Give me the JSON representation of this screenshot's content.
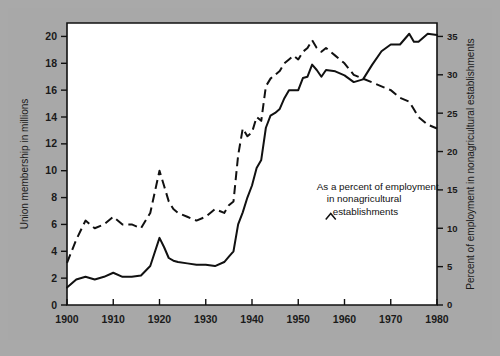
{
  "chart_data": {
    "type": "line",
    "title": "",
    "xlabel": "",
    "ylabel": "Union membership in millions",
    "y2label": "Percent of employment in nonagricultural establishments",
    "xlim": [
      1900,
      1980
    ],
    "ylim": [
      0,
      21
    ],
    "y2lim": [
      0,
      36.75
    ],
    "grid": false,
    "legend": "none",
    "xticks": [
      "1900",
      "1910",
      "1920",
      "1930",
      "1940",
      "1950",
      "1960",
      "1970",
      "1980"
    ],
    "xtick_values": [
      1900,
      1910,
      1920,
      1930,
      1940,
      1950,
      1960,
      1970,
      1980
    ],
    "yticks": [
      "0",
      "2",
      "4",
      "6",
      "8",
      "10",
      "12",
      "14",
      "16",
      "18",
      "20"
    ],
    "ytick_values": [
      0,
      2,
      4,
      6,
      8,
      10,
      12,
      14,
      16,
      18,
      20
    ],
    "y2ticks": [
      "0",
      "5",
      "10",
      "15",
      "20",
      "25",
      "30",
      "35"
    ],
    "y2tick_values": [
      0,
      5,
      10,
      15,
      20,
      25,
      30,
      35
    ],
    "annotations": [
      {
        "name": "percent-series-annotation",
        "lines": [
          "As a percent of employment",
          "in nonagricultural",
          "establishments"
        ],
        "x": 1954,
        "y": 8.6
      }
    ],
    "series": [
      {
        "name": "Union membership in millions",
        "style": "solid",
        "axis": "left",
        "x": [
          1900,
          1902,
          1904,
          1906,
          1908,
          1910,
          1912,
          1914,
          1916,
          1918,
          1920,
          1921,
          1922,
          1923,
          1924,
          1926,
          1928,
          1930,
          1932,
          1934,
          1935,
          1936,
          1937,
          1938,
          1939,
          1940,
          1941,
          1942,
          1943,
          1944,
          1945,
          1946,
          1947,
          1948,
          1949,
          1950,
          1951,
          1952,
          1953,
          1954,
          1955,
          1956,
          1958,
          1960,
          1962,
          1964,
          1966,
          1968,
          1970,
          1972,
          1974,
          1975,
          1976,
          1978,
          1980
        ],
        "values": [
          1.3,
          1.9,
          2.1,
          1.9,
          2.1,
          2.4,
          2.1,
          2.1,
          2.2,
          2.9,
          5.0,
          4.3,
          3.5,
          3.3,
          3.2,
          3.1,
          3.0,
          3.0,
          2.9,
          3.2,
          3.6,
          4.0,
          6.0,
          6.9,
          8.0,
          8.9,
          10.2,
          10.8,
          13.2,
          14.1,
          14.3,
          14.6,
          15.4,
          16.0,
          16.0,
          16.0,
          16.9,
          17.0,
          17.9,
          17.5,
          17.0,
          17.5,
          17.4,
          17.1,
          16.6,
          16.8,
          17.9,
          18.9,
          19.4,
          19.4,
          20.2,
          19.6,
          19.6,
          20.2,
          20.1
        ]
      },
      {
        "name": "As a percent of employment in nonagricultural establishments",
        "style": "dashed",
        "axis": "right",
        "x": [
          1900,
          1902,
          1904,
          1906,
          1908,
          1910,
          1912,
          1914,
          1916,
          1918,
          1920,
          1921,
          1922,
          1923,
          1924,
          1926,
          1928,
          1930,
          1932,
          1934,
          1935,
          1936,
          1937,
          1938,
          1939,
          1940,
          1941,
          1942,
          1943,
          1944,
          1945,
          1946,
          1947,
          1948,
          1949,
          1950,
          1951,
          1952,
          1953,
          1954,
          1955,
          1956,
          1958,
          1960,
          1962,
          1964,
          1966,
          1968,
          1970,
          1972,
          1974,
          1975,
          1976,
          1978,
          1980
        ],
        "values": [
          5.5,
          8.5,
          11.0,
          10.0,
          10.5,
          11.5,
          10.5,
          10.5,
          10.0,
          12.0,
          17.5,
          15.5,
          13.5,
          12.5,
          12.0,
          11.5,
          11.0,
          11.5,
          12.5,
          12.0,
          13.0,
          13.5,
          19.5,
          23.0,
          22.0,
          22.5,
          24.5,
          24.0,
          28.5,
          29.5,
          30.0,
          30.5,
          31.5,
          32.0,
          32.5,
          32.0,
          33.0,
          33.5,
          34.5,
          33.5,
          33.0,
          33.5,
          32.5,
          31.5,
          30.0,
          29.5,
          29.0,
          28.5,
          28.0,
          27.0,
          26.5,
          25.5,
          24.5,
          23.5,
          23.0
        ]
      }
    ]
  },
  "axes": {
    "left_title": "Union membership in millions",
    "right_title": "Percent of employment in nonagricultural establishments"
  }
}
